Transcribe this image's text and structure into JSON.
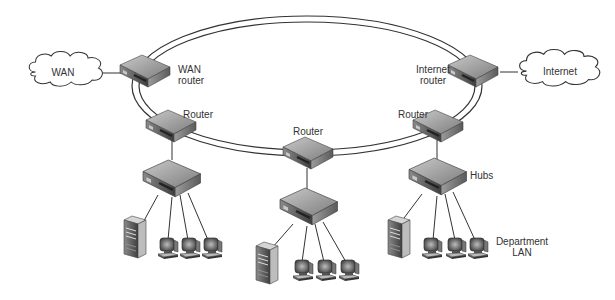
{
  "diagram": {
    "type": "network-topology",
    "clouds": [
      {
        "id": "wan",
        "label": "WAN"
      },
      {
        "id": "internet",
        "label": "Internet"
      }
    ],
    "labels": {
      "wan_router_line1": "WAN",
      "wan_router_line2": "router",
      "internet_router_line1": "Internet",
      "internet_router_line2": "router",
      "router_left": "Router",
      "router_center": "Router",
      "router_right": "Router",
      "hubs": "Hubs",
      "department_line1": "Department",
      "department_line2": "LAN"
    },
    "nodes": [
      {
        "id": "wan-router",
        "kind": "router",
        "icon": "router-icon"
      },
      {
        "id": "internet-router",
        "kind": "router",
        "icon": "router-icon"
      },
      {
        "id": "router-left",
        "kind": "router",
        "icon": "router-icon"
      },
      {
        "id": "router-center",
        "kind": "router",
        "icon": "router-icon"
      },
      {
        "id": "router-right",
        "kind": "router",
        "icon": "router-icon"
      },
      {
        "id": "hub-left",
        "kind": "hub",
        "icon": "hub-icon"
      },
      {
        "id": "hub-center",
        "kind": "hub",
        "icon": "hub-icon"
      },
      {
        "id": "hub-right",
        "kind": "hub",
        "icon": "hub-icon"
      }
    ],
    "lan_groups": [
      {
        "hub": "hub-left",
        "servers": 1,
        "workstations": 3
      },
      {
        "hub": "hub-center",
        "servers": 1,
        "workstations": 3
      },
      {
        "hub": "hub-right",
        "servers": 1,
        "workstations": 3
      }
    ],
    "backbone": "dual-ring",
    "colors": {
      "line": "#333333",
      "device_top": "#9a9a9a",
      "device_side": "#6e6e6e",
      "device_front": "#4a4a4a",
      "cloud_fill": "#ffffff"
    }
  }
}
